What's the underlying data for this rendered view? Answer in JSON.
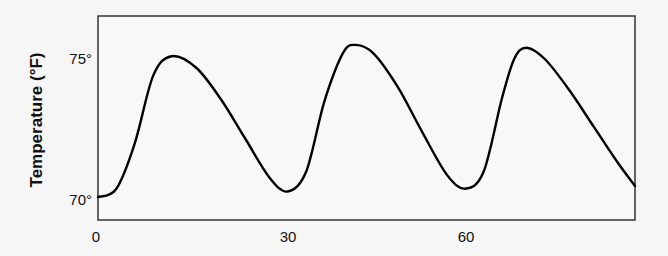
{
  "chart_data": {
    "type": "line",
    "title": "",
    "xlabel": "",
    "ylabel": "Temperature (°F)",
    "x_ticks": [
      {
        "value": 0,
        "label": "0"
      },
      {
        "value": 30,
        "label": "30"
      },
      {
        "value": 60,
        "label": "60"
      }
    ],
    "y_ticks": [
      {
        "value": 70,
        "label": "70°"
      },
      {
        "value": 75,
        "label": "75°"
      }
    ],
    "xlim": [
      0,
      88
    ],
    "ylim": [
      69.3,
      76.5
    ],
    "grid": false,
    "legend": null,
    "series": [
      {
        "name": "Temperature",
        "color": "#000000",
        "x": [
          0,
          3,
          6,
          9,
          12,
          16,
          20,
          24,
          28,
          31,
          34,
          37,
          40,
          42,
          45,
          49,
          53,
          57,
          60,
          63,
          66,
          68,
          70,
          73,
          77,
          81,
          85,
          88
        ],
        "values": [
          70.1,
          70.4,
          72.0,
          74.4,
          75.1,
          74.7,
          73.6,
          72.2,
          70.8,
          70.3,
          71.0,
          73.5,
          75.2,
          75.5,
          75.2,
          74.0,
          72.4,
          70.9,
          70.4,
          71.0,
          73.6,
          75.0,
          75.4,
          75.0,
          73.9,
          72.6,
          71.3,
          70.5
        ]
      }
    ]
  },
  "axes": {
    "ylabel": "Temperature (°F)",
    "x_tick_labels": [
      "0",
      "30",
      "60"
    ],
    "y_tick_labels": [
      "70°",
      "75°"
    ]
  }
}
